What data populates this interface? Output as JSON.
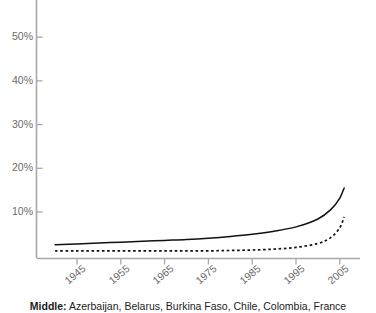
{
  "chart_data": {
    "type": "line",
    "title": "",
    "subtitle": "",
    "xlabel": "",
    "ylabel": "",
    "xlim": [
      1940,
      2008
    ],
    "ylim": [
      0,
      57
    ],
    "grid": false,
    "legend_position": "none",
    "yticks": [
      10,
      20,
      30,
      40,
      50
    ],
    "ytick_labels": [
      "10%",
      "20%",
      "30%",
      "40%",
      "50%"
    ],
    "xticks": [
      1945,
      1955,
      1965,
      1975,
      1985,
      1995,
      2005
    ],
    "xtick_labels": [
      "1945",
      "1955",
      "1965",
      "1975",
      "1985",
      "1995",
      "2005"
    ],
    "x": [
      1940,
      1945,
      1950,
      1955,
      1960,
      1965,
      1970,
      1975,
      1980,
      1985,
      1990,
      1995,
      2000,
      2003,
      2005,
      2006
    ],
    "series": [
      {
        "name": "solid-series",
        "style": "solid",
        "color": "#111111",
        "values": [
          2.5,
          2.7,
          2.9,
          3.1,
          3.3,
          3.5,
          3.7,
          4.0,
          4.4,
          4.9,
          5.6,
          6.6,
          8.4,
          10.6,
          13.2,
          15.5
        ]
      },
      {
        "name": "dashed-series",
        "style": "dashed",
        "color": "#111111",
        "values": [
          1.1,
          1.1,
          1.1,
          1.1,
          1.1,
          1.1,
          1.1,
          1.1,
          1.2,
          1.3,
          1.5,
          1.9,
          2.8,
          4.2,
          6.4,
          8.9
        ]
      }
    ]
  },
  "axes": {
    "axis_color": "#a8a8a8",
    "tick_color": "#a8a8a8",
    "label_color": "#6b6b6b"
  },
  "caption": {
    "group_label": "Middle:",
    "countries": "Azerbaijan, Belarus, Burkina Faso, Chile, Colombia, France"
  }
}
